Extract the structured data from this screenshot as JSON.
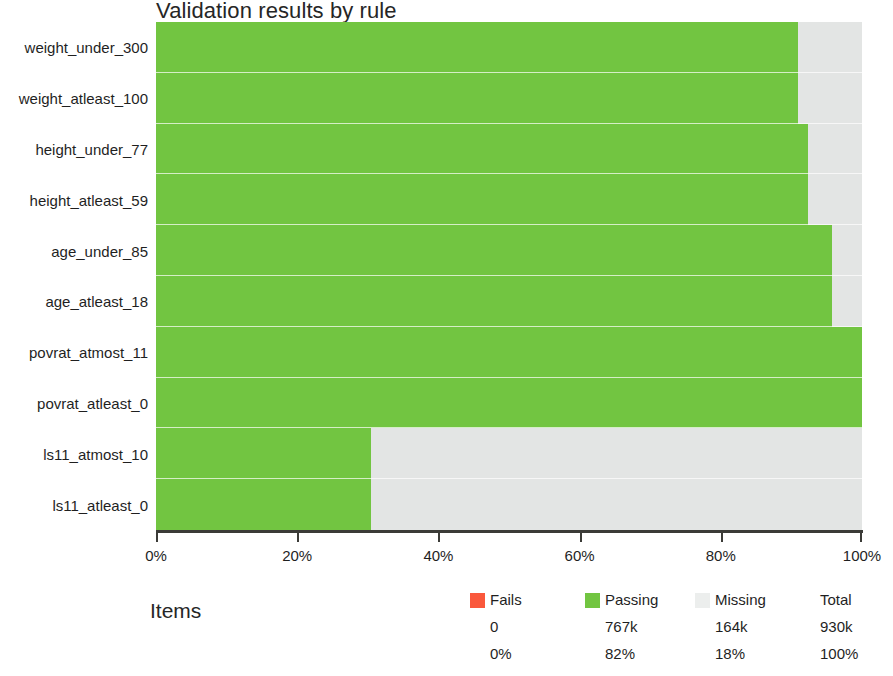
{
  "chart_data": {
    "type": "bar",
    "orientation": "horizontal",
    "stacked": true,
    "title": "Validation results by rule",
    "xlabel": "Items",
    "ylabel": "",
    "xlim": [
      0,
      100
    ],
    "xtick_labels": [
      "0%",
      "20%",
      "40%",
      "60%",
      "80%",
      "100%"
    ],
    "xticks": [
      0,
      20,
      40,
      60,
      80,
      100
    ],
    "grid": false,
    "legend_position": "bottom-right",
    "categories": [
      "weight_under_300",
      "weight_atleast_100",
      "height_under_77",
      "height_atleast_59",
      "age_under_85",
      "age_atleast_18",
      "povrat_atmost_11",
      "povrat_atleast_0",
      "ls11_atmost_10",
      "ls11_atleast_0"
    ],
    "series": [
      {
        "name": "Fails",
        "color": "#fa583c",
        "values": [
          0,
          0,
          0,
          0,
          0,
          0,
          0,
          0,
          0,
          0
        ]
      },
      {
        "name": "Passing",
        "color": "#72c541",
        "values": [
          90.9,
          90.9,
          92.4,
          92.4,
          95.8,
          95.8,
          100,
          100,
          30.5,
          30.5
        ]
      },
      {
        "name": "Missing",
        "color": "#e3e5e4",
        "values": [
          9.1,
          9.1,
          7.6,
          7.6,
          4.2,
          4.2,
          0,
          0,
          69.5,
          69.5
        ]
      }
    ]
  },
  "title": "Validation results by rule",
  "axis": {
    "x_title": "Items",
    "ticks": [
      {
        "label": "0%",
        "pct": 0
      },
      {
        "label": "20%",
        "pct": 20
      },
      {
        "label": "40%",
        "pct": 40
      },
      {
        "label": "60%",
        "pct": 60
      },
      {
        "label": "80%",
        "pct": 80
      },
      {
        "label": "100%",
        "pct": 100
      }
    ]
  },
  "rules": [
    {
      "label": "weight_under_300",
      "passing_pct": 90.9
    },
    {
      "label": "weight_atleast_100",
      "passing_pct": 90.9
    },
    {
      "label": "height_under_77",
      "passing_pct": 92.4
    },
    {
      "label": "height_atleast_59",
      "passing_pct": 92.4
    },
    {
      "label": "age_under_85",
      "passing_pct": 95.8
    },
    {
      "label": "age_atleast_18",
      "passing_pct": 95.8
    },
    {
      "label": "povrat_atmost_11",
      "passing_pct": 100
    },
    {
      "label": "povrat_atleast_0",
      "passing_pct": 100
    },
    {
      "label": "ls11_atmost_10",
      "passing_pct": 30.5
    },
    {
      "label": "ls11_atleast_0",
      "passing_pct": 30.5
    }
  ],
  "legend": {
    "columns": [
      {
        "name": "fails",
        "label": "Fails",
        "swatch": "#fa583c",
        "has_swatch": true,
        "count": "0",
        "pct": "0%"
      },
      {
        "name": "passing",
        "label": "Passing",
        "swatch": "#72c541",
        "has_swatch": true,
        "count": "767k",
        "pct": "82%"
      },
      {
        "name": "missing",
        "label": "Missing",
        "swatch": "#eceeed",
        "has_swatch": true,
        "count": "164k",
        "pct": "18%"
      },
      {
        "name": "total",
        "label": "Total",
        "swatch": "",
        "has_swatch": false,
        "count": "930k",
        "pct": "100%"
      }
    ]
  },
  "colors": {
    "passing": "#72c541",
    "fails": "#fa583c",
    "missing": "#e3e5e4",
    "axis": "#3b3b37",
    "text": "#1f1f1f"
  }
}
